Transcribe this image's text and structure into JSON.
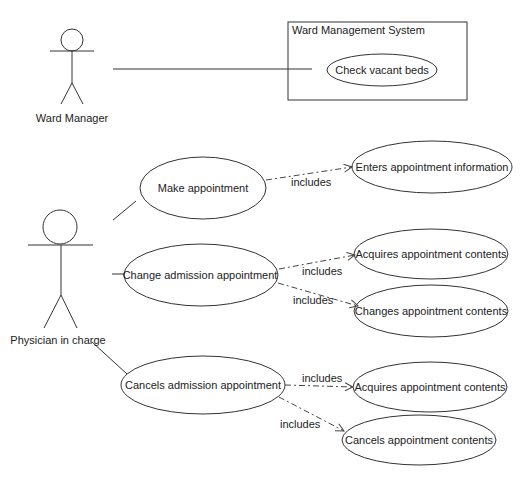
{
  "diagram": {
    "type": "uml-use-case",
    "system_boundary": {
      "title": "Ward Management System"
    },
    "actors": [
      {
        "id": "ward_manager",
        "label": "Ward Manager"
      },
      {
        "id": "physician",
        "label": "Physician in charge"
      }
    ],
    "use_cases": {
      "check_vacant_beds": "Check vacant beds",
      "make_appointment": "Make appointment",
      "enters_appointment_information": "Enters appointment information",
      "change_admission_appointment": "Change admission appointment",
      "acquires_appointment_contents_1": "Acquires appointment contents",
      "changes_appointment_contents": "Changes appointment contents",
      "cancels_admission_appointment": "Cancels admission appointment",
      "acquires_appointment_contents_2": "Acquires appointment contents",
      "cancels_appointment_contents": "Cancels appointment contents"
    },
    "relations": {
      "include_label": "includes",
      "includes": [
        {
          "from": "Make appointment",
          "to": "Enters appointment information",
          "label": "includes"
        },
        {
          "from": "Change admission appointment",
          "to": "Acquires appointment contents",
          "label": "includes"
        },
        {
          "from": "Change admission appointment",
          "to": "Changes appointment contents",
          "label": "includes"
        },
        {
          "from": "Cancels admission appointment",
          "to": "Acquires appointment contents",
          "label": "includes"
        },
        {
          "from": "Cancels admission appointment",
          "to": "Cancels appointment contents",
          "label": "includes"
        }
      ],
      "associations": [
        {
          "actor": "Ward Manager",
          "use_case": "Check vacant beds"
        },
        {
          "actor": "Physician in charge",
          "use_case": "Make appointment"
        },
        {
          "actor": "Physician in charge",
          "use_case": "Change admission appointment"
        },
        {
          "actor": "Physician in charge",
          "use_case": "Cancels admission appointment"
        }
      ]
    }
  }
}
